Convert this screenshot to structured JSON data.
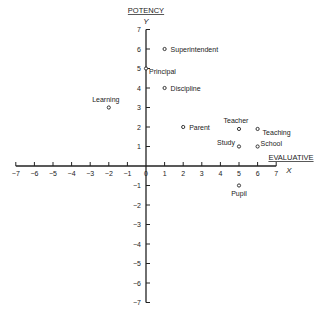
{
  "chart_data": {
    "type": "scatter",
    "title": "",
    "xlabel": "EVALUATIVE",
    "xvar": "X",
    "ylabel": "POTENCY",
    "yvar": "Y",
    "xlim": [
      -7,
      7
    ],
    "ylim": [
      -7,
      7
    ],
    "x_ticks": [
      -7,
      -6,
      -5,
      -4,
      -3,
      -2,
      -1,
      0,
      1,
      2,
      3,
      4,
      5,
      6,
      7
    ],
    "y_ticks": [
      -7,
      -6,
      -5,
      -4,
      -3,
      -2,
      -1,
      1,
      2,
      3,
      4,
      5,
      6,
      7
    ],
    "grid": false,
    "legend": null,
    "points": [
      {
        "label": "Superintendent",
        "x": 1,
        "y": 6,
        "lx": 6,
        "ly": 3,
        "anchor": "start"
      },
      {
        "label": "Principal",
        "x": 0,
        "y": 5,
        "lx": 3,
        "ly": 5,
        "anchor": "start"
      },
      {
        "label": "Discipline",
        "x": 1,
        "y": 4,
        "lx": 6,
        "ly": 3,
        "anchor": "start"
      },
      {
        "label": "Learning",
        "x": -2,
        "y": 3,
        "lx": -3,
        "ly": -6,
        "anchor": "middle"
      },
      {
        "label": "Parent",
        "x": 2,
        "y": 2,
        "lx": 6,
        "ly": 3,
        "anchor": "start"
      },
      {
        "label": "Teacher",
        "x": 5,
        "y": 1.9,
        "lx": -3,
        "ly": -6,
        "anchor": "middle"
      },
      {
        "label": "Teaching",
        "x": 6,
        "y": 1.9,
        "lx": 5,
        "ly": 6,
        "anchor": "start"
      },
      {
        "label": "Study",
        "x": 5,
        "y": 1,
        "lx": -4,
        "ly": -2,
        "anchor": "end"
      },
      {
        "label": "School",
        "x": 6,
        "y": 1,
        "lx": 3,
        "ly": -1,
        "anchor": "start"
      },
      {
        "label": "Pupil",
        "x": 5,
        "y": -1,
        "lx": 0,
        "ly": 10,
        "anchor": "middle"
      }
    ]
  }
}
